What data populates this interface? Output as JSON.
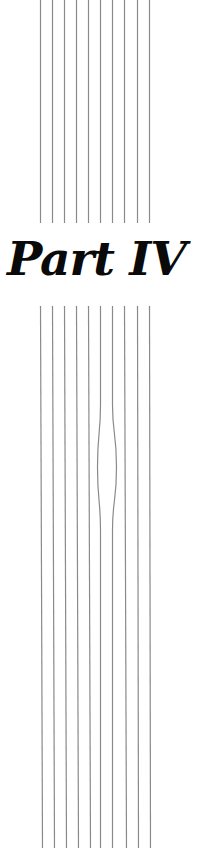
{
  "page": {
    "title": "Part IV"
  },
  "decoration": {
    "line_color": "#8a8a8a",
    "top_lines": {
      "y_start": 0,
      "y_end": 223,
      "x": [
        40,
        52,
        64,
        76,
        88,
        100,
        112,
        124,
        137,
        149
      ]
    },
    "bottom_lines": {
      "y_start": 306,
      "y_end": 848,
      "x_start": [
        40,
        52,
        64,
        76,
        88,
        100,
        112,
        124,
        137,
        149
      ],
      "x_end": [
        42,
        54,
        66,
        78,
        90,
        100,
        112,
        126,
        138,
        150
      ],
      "bulge": {
        "line_indices": [
          5,
          6
        ],
        "offsets": [
          -3,
          4
        ],
        "y_from": 405,
        "y_peak": 467,
        "y_to": 530
      }
    }
  }
}
